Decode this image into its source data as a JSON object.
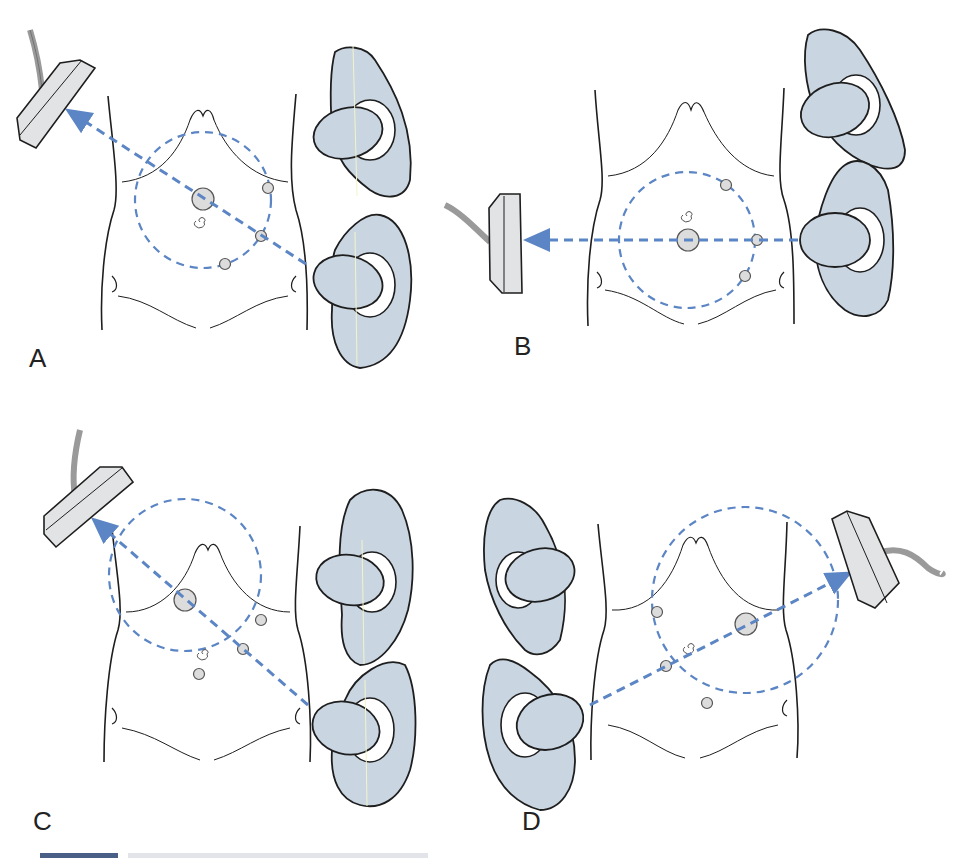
{
  "figure": {
    "panels": [
      {
        "id": "A",
        "label": "A",
        "label_pos": [
          29,
          355
        ],
        "origin": [
          0,
          0
        ],
        "probe": "upper-left",
        "arrow_dir": "to-upper-left",
        "breasts_side": "right",
        "circle": {
          "cx": 203,
          "cy": 200,
          "r": 68
        }
      },
      {
        "id": "B",
        "label": "B",
        "label_pos": [
          514,
          345
        ],
        "origin": [
          481,
          0
        ],
        "probe": "left",
        "arrow_dir": "to-left",
        "breasts_side": "right",
        "circle": {
          "cx": 687,
          "cy": 240,
          "r": 68
        }
      },
      {
        "id": "C",
        "label": "C",
        "label_pos": [
          33,
          800
        ],
        "origin": [
          0,
          420
        ],
        "probe": "upper-left",
        "arrow_dir": "to-upper-left",
        "breasts_side": "right",
        "circle": {
          "cx": 185,
          "cy": 575,
          "r": 76
        }
      },
      {
        "id": "D",
        "label": "D",
        "label_pos": [
          522,
          800
        ],
        "origin": [
          481,
          420
        ],
        "probe": "right",
        "arrow_dir": "to-upper-right",
        "breasts_side": "left",
        "circle": {
          "cx": 745,
          "cy": 600,
          "r": 93
        }
      }
    ],
    "colors": {
      "dashed_line": "#5b85c4",
      "cup_fill": "#c9d6e2",
      "probe_fill": "#e2e3e4",
      "cable": "#9a9a9a",
      "outline": "#1e1e1e",
      "dot_fill": "#dcdcdc",
      "midline": "#f4f4c8"
    },
    "footer": {
      "bar_color": "#4a5f86"
    }
  }
}
